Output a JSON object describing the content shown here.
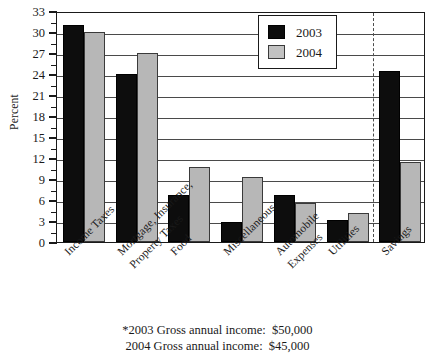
{
  "chart_data": {
    "type": "bar",
    "title": "",
    "xlabel": "",
    "ylabel": "Percent",
    "ylim": [
      0,
      33
    ],
    "ytick_step": 3,
    "yticks": [
      0,
      3,
      6,
      9,
      12,
      15,
      18,
      21,
      24,
      27,
      30,
      33
    ],
    "grid": true,
    "legend_position": "top-right",
    "categories": [
      "Income Taxes",
      "Mortgage, Insurance,\nProperty Taxes",
      "Food",
      "Miscellaneous",
      "Automobile\nExpenses",
      "Utilities",
      "Savings"
    ],
    "category_labels": [
      {
        "line1": "Income Taxes",
        "line2": ""
      },
      {
        "line1": "Mortgage, Insurance,",
        "line2": "Property Taxes"
      },
      {
        "line1": "Food",
        "line2": ""
      },
      {
        "line1": "Miscellaneous",
        "line2": ""
      },
      {
        "line1": "Automobile",
        "line2": "Expenses"
      },
      {
        "line1": "Utilities",
        "line2": ""
      },
      {
        "line1": "Savings",
        "line2": ""
      }
    ],
    "series": [
      {
        "name": "2003",
        "color": "#0d0d0d",
        "values": [
          31.0,
          24.0,
          6.7,
          2.8,
          6.7,
          3.1,
          24.4
        ]
      },
      {
        "name": "2004",
        "color": "#b7b7b7",
        "values": [
          30.0,
          27.0,
          10.7,
          9.3,
          5.6,
          4.2,
          11.4
        ]
      }
    ],
    "annotations": [
      {
        "type": "dashed-vline",
        "before_category": "Savings"
      }
    ]
  },
  "legend": {
    "items": [
      {
        "label": "2003",
        "color": "#0d0d0d"
      },
      {
        "label": "2004",
        "color": "#b7b7b7"
      }
    ]
  },
  "footnotes": [
    "*2003 Gross annual income:  $50,000",
    "2004 Gross annual income:  $45,000"
  ]
}
